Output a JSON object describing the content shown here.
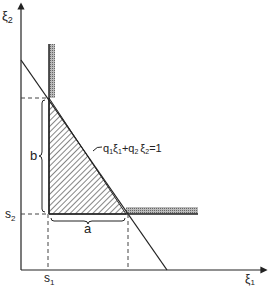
{
  "diagram": {
    "axes": {
      "x_label": "ξ",
      "x_sub": "1",
      "y_label": "ξ",
      "y_sub": "2"
    },
    "ticks": {
      "s1": {
        "base": "s",
        "sub": "1"
      },
      "s2": {
        "base": "s",
        "sub": "2"
      }
    },
    "brace_labels": {
      "a": "a",
      "b": "b"
    },
    "line_equation": {
      "q1": "q",
      "q1_sub": "1",
      "xi1": "ξ",
      "xi1_sub": "1",
      "plus": "+",
      "q2": "q",
      "q2_sub": "2",
      "xi2": "ξ",
      "xi2_sub": "2",
      "rhs": "=1"
    },
    "colors": {
      "line": "#222222",
      "hatch": "#333333",
      "bar": "#999999"
    }
  }
}
